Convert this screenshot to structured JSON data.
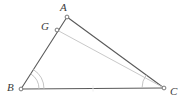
{
  "figure": {
    "type": "geometry-diagram",
    "width": 188,
    "height": 105,
    "background_color": "#ffffff",
    "colors": {
      "edge_dark": "#5a5a5a",
      "edge_light": "#c9c9c9",
      "arc": "#bdbdbd",
      "label": "#3a3a3a",
      "marker_stroke": "#6a6a6a",
      "marker_fill": "#ffffff"
    },
    "points": [
      {
        "id": "A",
        "label": "A",
        "x": 67,
        "y": 17,
        "label_x": 60,
        "label_y": 2
      },
      {
        "id": "G",
        "label": "G",
        "x": 57,
        "y": 30,
        "label_x": 41,
        "label_y": 21
      },
      {
        "id": "B",
        "label": "B",
        "x": 21,
        "y": 89,
        "label_x": 7,
        "label_y": 82
      },
      {
        "id": "C",
        "label": "C",
        "x": 164,
        "y": 88,
        "label_x": 170,
        "label_y": 86
      }
    ],
    "segments": [
      {
        "id": "AB",
        "from": "A",
        "to": "B",
        "style": "dark",
        "label": "segment-a-b"
      },
      {
        "id": "AC",
        "from": "A",
        "to": "C",
        "style": "dark",
        "label": "segment-a-c"
      },
      {
        "id": "BC",
        "from": "B",
        "to": "C",
        "style": "dark",
        "label": "segment-b-c"
      },
      {
        "id": "GC",
        "from": "G",
        "to": "C",
        "style": "light",
        "label": "segment-g-c"
      }
    ],
    "angle_marks": [
      {
        "id": "angle-B",
        "vertex": "B",
        "arcs": 2,
        "radii": [
          18,
          23
        ]
      },
      {
        "id": "angle-C",
        "vertex": "C",
        "arcs": 1,
        "radii": [
          22
        ]
      }
    ],
    "tick_marks": [
      {
        "id": "tick-bc-midpoint",
        "x": 93,
        "y": 88
      }
    ]
  }
}
